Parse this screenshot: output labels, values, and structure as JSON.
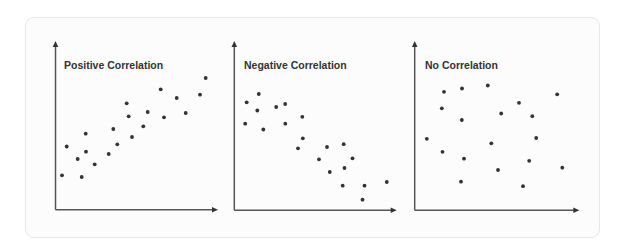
{
  "frame": {
    "background": "#fcfcfc",
    "border": "#e7e7e7"
  },
  "colors": {
    "axis": "#555555",
    "dot": "#333333",
    "title": "#333333"
  },
  "chart_data": [
    {
      "type": "scatter",
      "title": "Positive Correlation",
      "xlabel": "",
      "ylabel": "",
      "grid": false,
      "axes": {
        "origin": [
          55.5,
          209.7
        ],
        "x_end": 218,
        "y_end": 41
      },
      "points": [
        [
          205.7,
          78
        ],
        [
          160.7,
          89.3
        ],
        [
          200,
          94.7
        ],
        [
          176.7,
          98
        ],
        [
          126.7,
          103.3
        ],
        [
          147.7,
          112
        ],
        [
          128.7,
          116.3
        ],
        [
          164,
          117.3
        ],
        [
          185.7,
          113
        ],
        [
          143.3,
          126.3
        ],
        [
          113.3,
          129
        ],
        [
          132,
          137
        ],
        [
          85.7,
          133.7
        ],
        [
          117.3,
          144.3
        ],
        [
          66.7,
          146.5
        ],
        [
          77.7,
          159
        ],
        [
          86,
          151.7
        ],
        [
          108.7,
          154
        ],
        [
          94.7,
          164.3
        ],
        [
          62,
          175.3
        ],
        [
          81.7,
          177
        ]
      ]
    },
    {
      "type": "scatter",
      "title": "Negative Correlation",
      "xlabel": "",
      "ylabel": "",
      "grid": false,
      "axes": {
        "origin": [
          234.3,
          210.2
        ],
        "x_end": 396.7,
        "y_end": 41
      },
      "points": [
        [
          258.8,
          94
        ],
        [
          246.7,
          102.3
        ],
        [
          257.3,
          110.5
        ],
        [
          276.2,
          107
        ],
        [
          285.2,
          104
        ],
        [
          302.3,
          116.8
        ],
        [
          245.2,
          123.7
        ],
        [
          263.3,
          129.5
        ],
        [
          285.3,
          123.7
        ],
        [
          302.8,
          138.3
        ],
        [
          298,
          148.3
        ],
        [
          327,
          147
        ],
        [
          343.7,
          144.2
        ],
        [
          319,
          159.3
        ],
        [
          352.5,
          158.3
        ],
        [
          329.8,
          172
        ],
        [
          344.5,
          168
        ],
        [
          342.7,
          185.7
        ],
        [
          364.5,
          185.7
        ],
        [
          386.8,
          182
        ],
        [
          362.5,
          199.7
        ]
      ]
    },
    {
      "type": "scatter",
      "title": "No Correlation",
      "xlabel": "",
      "ylabel": "",
      "grid": false,
      "axes": {
        "origin": [
          414.7,
          210.3
        ],
        "x_end": 579.3,
        "y_end": 41
      },
      "points": [
        [
          444,
          91.8
        ],
        [
          462,
          88.5
        ],
        [
          487.8,
          85.5
        ],
        [
          441.8,
          108.3
        ],
        [
          501.2,
          113.5
        ],
        [
          461.8,
          120
        ],
        [
          426.8,
          138.8
        ],
        [
          491.3,
          143.3
        ],
        [
          442.5,
          151.8
        ],
        [
          464,
          158.7
        ],
        [
          498,
          170
        ],
        [
          461,
          181.7
        ],
        [
          519,
          102.8
        ],
        [
          557.2,
          94.3
        ],
        [
          532.3,
          116.2
        ],
        [
          536.2,
          138
        ],
        [
          529.2,
          160.8
        ],
        [
          562.3,
          167.7
        ],
        [
          523,
          186.2
        ]
      ]
    }
  ],
  "panels": [
    {
      "title": "Positive Correlation"
    },
    {
      "title": "Negative Correlation"
    },
    {
      "title": "No Correlation"
    }
  ]
}
